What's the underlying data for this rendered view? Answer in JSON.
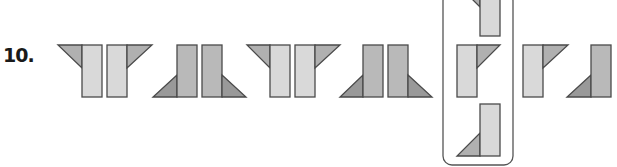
{
  "question": {
    "number_label": "10."
  },
  "colors": {
    "stroke": "#4a4a4a",
    "light_fill": "#d9d9d9",
    "medium_fill": "#b9b9b9",
    "triangle_light": "#b0b0b0",
    "triangle_dark": "#999999",
    "box_stroke": "#555555",
    "background": "#ffffff"
  },
  "sequence": [
    {
      "index": 1,
      "shape": "two light bars with triangles flaring out at top (Y-shape)"
    },
    {
      "index": 2,
      "shape": "two medium bars with triangles flaring out at bottom"
    },
    {
      "index": 3,
      "shape": "two light bars with triangles flaring out at top (Y-shape)"
    },
    {
      "index": 4,
      "shape": "two medium bars with triangles flaring out at bottom"
    }
  ],
  "options_box": {
    "label": "answer options",
    "options": [
      {
        "position": "top",
        "shape": "light bar with triangle at top-left (partially cut off)"
      },
      {
        "position": "middle",
        "shape": "light bar with triangle at top-right"
      },
      {
        "position": "bottom",
        "shape": "light bar with triangle at bottom-left"
      }
    ]
  },
  "trailing": [
    {
      "index": 6,
      "shape": "light bar with triangle at top-right"
    },
    {
      "index": 7,
      "shape": "medium bar with triangle at bottom-left"
    }
  ]
}
